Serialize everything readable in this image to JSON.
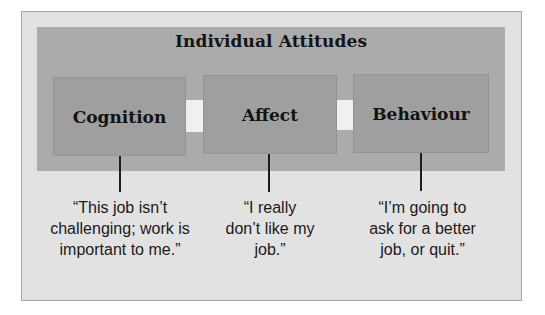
{
  "diagram": {
    "title": "Individual Attitudes",
    "stages": [
      {
        "label": "Cognition"
      },
      {
        "label": "Affect"
      },
      {
        "label": "Behaviour"
      }
    ],
    "quotes": [
      {
        "lines": [
          "“This job isn’t",
          "challenging; work is",
          "important to me.”"
        ]
      },
      {
        "lines": [
          "“I really",
          "don’t like my",
          "job.”"
        ]
      },
      {
        "lines": [
          "“I’m going to",
          "ask for a better",
          "job, or quit.”"
        ]
      }
    ],
    "flow_icons": [
      "arrow-right-icon",
      "arrow-right-icon"
    ],
    "colors": {
      "page_background": "#ffffff",
      "outer_frame_fill": "#e2e2e2",
      "outer_frame_border": "#a6a6a6",
      "inner_panel": "#ababab",
      "stage_box": "#9f9f9f",
      "arrow_fill": "#f0f0f0",
      "text": "#141414"
    }
  }
}
